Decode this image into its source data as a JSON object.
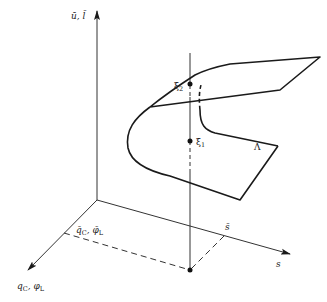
{
  "diagram": {
    "type": "3d-surface-fold",
    "axes": {
      "vertical": {
        "label": "ū, l̄"
      },
      "depth": {
        "label_main": "q",
        "label_sub1": "C",
        "sep": ", ",
        "label_main2": "φ",
        "label_sub2": "L"
      },
      "horizontal": {
        "label": "s"
      }
    },
    "markers": {
      "q_bar": {
        "label_main": "q̄",
        "label_sub1": "C",
        "sep": ", ",
        "label_main2": "φ̄",
        "label_sub2": "L"
      },
      "s_bar": {
        "label": "s̄"
      },
      "xi_1": {
        "label": "ξ̄",
        "sub": "1"
      },
      "xi_2": {
        "label": "ξ̄",
        "sub": "2"
      }
    },
    "surface": {
      "label": "Λ"
    },
    "colors": {
      "line": "#1a1a1a",
      "text": "#222222",
      "background": "#ffffff"
    }
  }
}
